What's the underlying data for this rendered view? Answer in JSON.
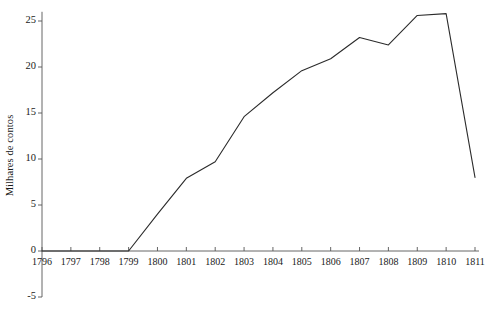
{
  "chart_data": {
    "type": "line",
    "title": "",
    "xlabel": "",
    "ylabel": "Milhares de contos",
    "x": [
      1796,
      1797,
      1798,
      1799,
      1800,
      1801,
      1802,
      1803,
      1804,
      1805,
      1806,
      1807,
      1808,
      1809,
      1810,
      1811
    ],
    "categories": [
      "1796",
      "1797",
      "1798",
      "1799",
      "1800",
      "1801",
      "1802",
      "1803",
      "1804",
      "1805",
      "1806",
      "1807",
      "1808",
      "1809",
      "1810",
      "1811"
    ],
    "values": [
      0,
      0,
      0,
      0,
      4.0,
      7.9,
      9.7,
      14.6,
      17.2,
      19.6,
      20.9,
      23.2,
      22.4,
      25.6,
      25.8,
      8.0
    ],
    "ylim": [
      -5,
      26
    ],
    "yticks": [
      -5,
      0,
      5,
      10,
      15,
      20,
      25
    ],
    "ytick_labels": [
      "-5",
      "0",
      "5",
      "10",
      "15",
      "20",
      "25"
    ],
    "xlim": [
      1796,
      1811
    ],
    "grid": false,
    "legend": null,
    "line_color": "#2b2b2b",
    "axis_color": "#555555",
    "background": "#ffffff",
    "markers": false
  }
}
